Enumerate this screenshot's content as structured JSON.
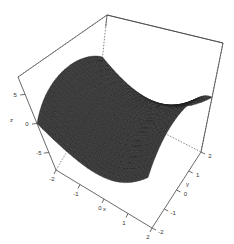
{
  "chart_data": {
    "type": "surface3d",
    "title": "",
    "function": "z = x^2 - y^2",
    "xlabel": "x",
    "ylabel": "y",
    "zlabel": "z",
    "xlim": [
      -2,
      2
    ],
    "ylim": [
      -2,
      2
    ],
    "zlim": [
      -8,
      8
    ],
    "x_ticks": [
      "-2",
      "-1",
      "0",
      "1",
      "2"
    ],
    "y_ticks": [
      "-2",
      "-1",
      "0",
      "1",
      "2"
    ],
    "z_ticks": [
      "-5",
      "0",
      "5"
    ],
    "grid_resolution": 25,
    "surface_color": "#3c3c3c",
    "mesh_color": "#1a1a1a",
    "box": true
  }
}
